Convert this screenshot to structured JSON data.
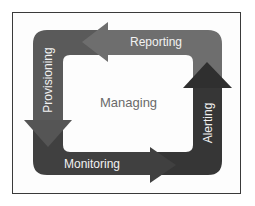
{
  "diagram": {
    "center_label": "Managing",
    "stages": [
      {
        "label": "Reporting",
        "position": "top",
        "direction": "left",
        "color": "#6e6e6e"
      },
      {
        "label": "Provisioning",
        "position": "left",
        "direction": "down",
        "color": "#5a5a5a"
      },
      {
        "label": "Monitoring",
        "position": "bottom",
        "direction": "right",
        "color": "#404040"
      },
      {
        "label": "Alerting",
        "position": "right",
        "direction": "up",
        "color": "#343434"
      }
    ],
    "colors": {
      "frame_border": "#3a3a3a",
      "inner_background": "#ffffff",
      "label_text": "#f2f2f2",
      "center_text": "#6a6a6a"
    }
  }
}
